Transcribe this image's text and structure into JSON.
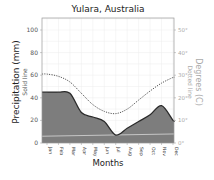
{
  "chart_data": {
    "type": "area",
    "title": "Yulara, Australia",
    "xlabel": "Months",
    "ylabel": "Precipitation (mm)",
    "ylabel_sub": "Solid line",
    "y2label": "Degrees (C)",
    "y2label_sub": "Dotted line",
    "categories": [
      "Jan",
      "Feb",
      "Mar",
      "Apr",
      "May",
      "Jun",
      "Jul",
      "Aug",
      "Sep",
      "Oct",
      "Nov",
      "Dec"
    ],
    "ylim": [
      0,
      110
    ],
    "yticks": [
      0,
      20,
      40,
      60,
      80,
      100
    ],
    "y2lim": [
      0,
      55
    ],
    "y2ticks": [
      "0°",
      "10°",
      "20°",
      "30°",
      "40°",
      "50°"
    ],
    "grid": true,
    "series": [
      {
        "name": "Precipitation (mm)",
        "style": "solid-filled",
        "axis": "left",
        "values": [
          45,
          45,
          44,
          27,
          23,
          19,
          7,
          13,
          19,
          25,
          33,
          20
        ]
      },
      {
        "name": "Temperature (°C)",
        "style": "dotted",
        "axis": "right",
        "values": [
          30.5,
          29.5,
          27,
          22,
          17,
          14,
          13,
          15,
          19,
          23,
          26.5,
          29
        ]
      }
    ],
    "reference_line": {
      "name": "light line",
      "start": 6,
      "end": 8
    },
    "colors": {
      "fill": "#7d7d7d",
      "line": "#2a2a2a",
      "dotted": "#555555",
      "reference": "#d8d8d8",
      "grid": "#ececec",
      "axis": "#999999",
      "right_axis_text": "#aaaaaa"
    }
  }
}
